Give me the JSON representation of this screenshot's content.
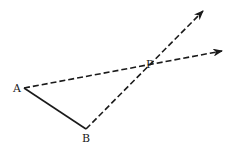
{
  "diagram": {
    "points": {
      "A": {
        "label": "A",
        "x": 24,
        "y": 88
      },
      "B": {
        "label": "B",
        "x": 86,
        "y": 129
      },
      "P": {
        "label": "P",
        "x": 152,
        "y": 63
      }
    },
    "segments": [
      {
        "from": "A",
        "to": "B",
        "style": "solid"
      }
    ],
    "rays": [
      {
        "from": "A",
        "through": "P",
        "style": "dashed",
        "arrow_tip": {
          "x": 223,
          "y": 51
        }
      },
      {
        "from": "B",
        "through": "P",
        "style": "dashed",
        "arrow_tip": {
          "x": 204,
          "y": 10
        }
      }
    ],
    "colors": {
      "stroke": "#1a1a1a",
      "background": "#ffffff"
    }
  }
}
